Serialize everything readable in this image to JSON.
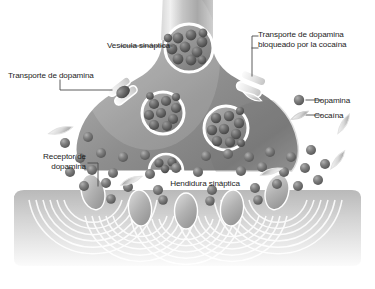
{
  "figure": {
    "type": "scientific-diagram",
    "palette": {
      "background": "#ffffff",
      "terminal_light": "#e8e8e8",
      "terminal_mid": "#9a9a9a",
      "terminal_dark": "#6f6f6f",
      "membrane": "#ffffff",
      "dopamine": "#7a7a7a",
      "dopamine_dark": "#575757",
      "receptor": "#b4b4b4",
      "postsynaptic": "#cfcfcf",
      "label_text": "#1c1c1c",
      "leader_line": "#4a4a4a"
    }
  },
  "labels": {
    "vesicula": "Vesícula sináptica",
    "transporte": "Transporte de dopamina",
    "bloqueado_line1": "Transporte de dopamina",
    "bloqueado_line2": "bloqueado por la cocaína",
    "receptor_line1": "Receptor de",
    "receptor_line2": "dopamina",
    "hendidura": "Hendidura sináptica"
  },
  "legend": {
    "items": [
      {
        "key": "dopamina",
        "label": "Dopamina",
        "marker": "sphere-icon"
      },
      {
        "key": "cocaina",
        "label": "Cocaína",
        "marker": "cone-icon"
      }
    ]
  },
  "structures": {
    "vesicles": [
      {
        "cx": 189,
        "cy": 48,
        "r": 24,
        "dots": 11
      },
      {
        "cx": 163,
        "cy": 113,
        "r": 21,
        "dots": 10
      },
      {
        "cx": 226,
        "cy": 128,
        "r": 22,
        "dots": 10
      },
      {
        "cx": 166,
        "cy": 156,
        "r": 17,
        "dots": 5
      }
    ],
    "transporters": [
      {
        "name": "open-transporter",
        "x": 122,
        "y": 92,
        "angle": -38,
        "blocked": false
      },
      {
        "name": "blocked-transporter",
        "x": 250,
        "y": 84,
        "angle": 22,
        "blocked": true
      }
    ],
    "receptors": [
      {
        "cx": 93,
        "cy": 196
      },
      {
        "cx": 140,
        "cy": 212
      },
      {
        "cx": 186,
        "cy": 214
      },
      {
        "cx": 232,
        "cy": 211
      },
      {
        "cx": 277,
        "cy": 195
      }
    ],
    "cocaine_molecules": [
      {
        "x": 60,
        "y": 130,
        "angle": -18
      },
      {
        "x": 132,
        "y": 181,
        "angle": 155
      },
      {
        "x": 343,
        "y": 124,
        "angle": -62
      },
      {
        "x": 337,
        "y": 160,
        "angle": -55
      },
      {
        "x": 272,
        "y": 172,
        "angle": 160
      }
    ],
    "cleft_dopamine_count": 36,
    "wave_receptor_count": 5
  }
}
